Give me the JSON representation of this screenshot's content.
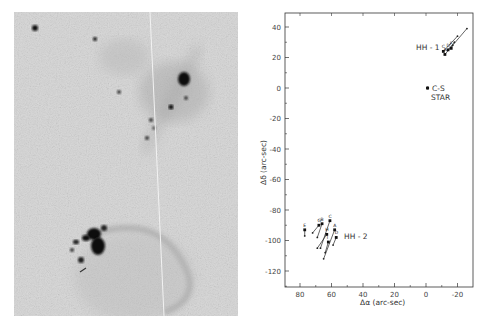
{
  "figure": {
    "left_panel": {
      "description": "Grayscale photographic image of HH-1/HH-2 region (nebular knots and bow shock)"
    },
    "right_panel": {
      "x_axis_label": "Δα (arc-sec)",
      "y_axis_label": "Δδ (arc-sec)",
      "x_ticks": [
        "80",
        "60",
        "40",
        "20",
        "0",
        "-20"
      ],
      "y_ticks": [
        "40",
        "20",
        "0",
        "-20",
        "-40",
        "-60",
        "-80",
        "-100",
        "-120"
      ],
      "labels": {
        "hh1": "HH - 1",
        "hh2": "HH - 2",
        "cs_star_line1": "C-S",
        "cs_star_line2": "STAR"
      }
    }
  },
  "chart_data": {
    "type": "scatter",
    "title": "",
    "xlabel": "Δα (arc-sec)",
    "ylabel": "Δδ (arc-sec)",
    "xlim": [
      90,
      -32
    ],
    "ylim": [
      -130,
      50
    ],
    "x_ticks": [
      80,
      60,
      40,
      20,
      0,
      -20
    ],
    "y_ticks": [
      40,
      20,
      0,
      -20,
      -40,
      -60,
      -80,
      -100,
      -120
    ],
    "grid": false,
    "annotations": [
      "HH - 1",
      "HH - 2",
      "C-S STAR"
    ],
    "series": [
      {
        "name": "C-S STAR",
        "points": [
          {
            "x": -1,
            "y": 0
          }
        ]
      },
      {
        "name": "HH-1 knots (proper-motion vectors)",
        "points": [
          {
            "label": "A",
            "x": -12,
            "y": 22,
            "vx": -26,
            "vy": 39
          },
          {
            "label": "C",
            "x": -11,
            "y": 24,
            "vx": -20,
            "vy": 34
          },
          {
            "label": "D",
            "x": -14,
            "y": 25,
            "vx": -18,
            "vy": 30
          },
          {
            "label": "F",
            "x": -16,
            "y": 26,
            "vx": -17,
            "vy": 28
          }
        ]
      },
      {
        "name": "HH-2 knots (proper-motion vectors)",
        "points": [
          {
            "label": "E",
            "x": 77,
            "y": -93,
            "vx": 77,
            "vy": -97
          },
          {
            "label": "G",
            "x": 68,
            "y": -90,
            "vx": 72,
            "vy": -95
          },
          {
            "label": "B",
            "x": 66,
            "y": -89,
            "vx": 69,
            "vy": -98
          },
          {
            "label": "C",
            "x": 61,
            "y": -87,
            "vx": 67,
            "vy": -105
          },
          {
            "label": "H",
            "x": 63,
            "y": -96,
            "vx": 69,
            "vy": -105
          },
          {
            "label": "A",
            "x": 58,
            "y": -93,
            "vx": 65,
            "vy": -112
          },
          {
            "label": "I",
            "x": 62,
            "y": -101,
            "vx": 64,
            "vy": -108
          },
          {
            "label": "D",
            "x": 57,
            "y": -98,
            "vx": 59,
            "vy": -103
          }
        ]
      }
    ]
  }
}
